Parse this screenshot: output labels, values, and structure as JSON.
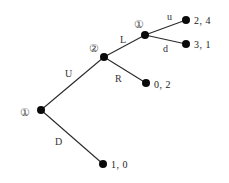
{
  "diagram": {
    "type": "extensive-form game tree",
    "nodes": {
      "root": {
        "player": "①",
        "x": 41,
        "y": 110
      },
      "p2": {
        "player": "②",
        "x": 104,
        "y": 57
      },
      "p1b": {
        "player": "①",
        "x": 145,
        "y": 35
      }
    },
    "edges": {
      "U": "U",
      "D": "D",
      "L": "L",
      "R": "R",
      "u": "u",
      "d": "d"
    },
    "payoffs": {
      "uu": "2, 4",
      "ud": "3, 1",
      "R": "0, 2",
      "D": "1, 0"
    }
  }
}
